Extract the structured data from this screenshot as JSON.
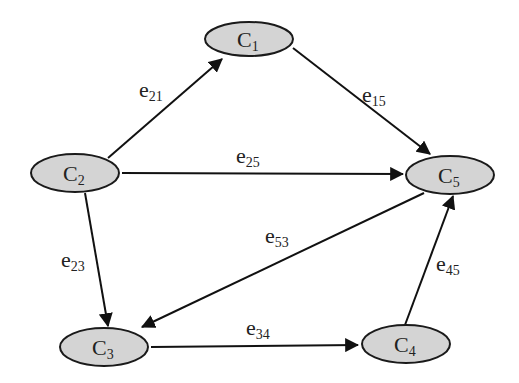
{
  "diagram": {
    "type": "directed-graph",
    "nodes": [
      {
        "id": "C1",
        "base": "C",
        "sub": "1",
        "cx": 249,
        "cy": 39
      },
      {
        "id": "C2",
        "base": "C",
        "sub": "2",
        "cx": 75,
        "cy": 173
      },
      {
        "id": "C3",
        "base": "C",
        "sub": "3",
        "cx": 104,
        "cy": 347
      },
      {
        "id": "C4",
        "base": "C",
        "sub": "4",
        "cx": 406,
        "cy": 344
      },
      {
        "id": "C5",
        "base": "C",
        "sub": "5",
        "cx": 450,
        "cy": 175
      }
    ],
    "edges": [
      {
        "id": "e21",
        "from": "C2",
        "to": "C1",
        "base": "e",
        "sub": "21"
      },
      {
        "id": "e15",
        "from": "C1",
        "to": "C5",
        "base": "e",
        "sub": "15"
      },
      {
        "id": "e25",
        "from": "C2",
        "to": "C5",
        "base": "e",
        "sub": "25"
      },
      {
        "id": "e23",
        "from": "C2",
        "to": "C3",
        "base": "e",
        "sub": "23"
      },
      {
        "id": "e53",
        "from": "C5",
        "to": "C3",
        "base": "e",
        "sub": "53"
      },
      {
        "id": "e34",
        "from": "C3",
        "to": "C4",
        "base": "e",
        "sub": "34"
      },
      {
        "id": "e45",
        "from": "C4",
        "to": "C5",
        "base": "e",
        "sub": "45"
      }
    ]
  }
}
